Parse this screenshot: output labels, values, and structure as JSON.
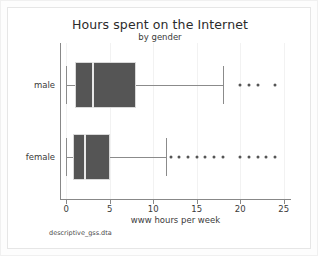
{
  "chart_data": {
    "type": "box",
    "title": "Hours spent on the Internet",
    "subtitle": "by gender",
    "xlabel": "www hours per week",
    "ylabel": "",
    "note": "descriptive_gss.dta",
    "xlim": [
      -0.6,
      25.6
    ],
    "xticks": [
      0,
      5,
      10,
      15,
      20,
      25
    ],
    "xticklabels": [
      "0",
      "5",
      "10",
      "15",
      "20",
      "25"
    ],
    "grid": "vertical",
    "orientation": "horizontal",
    "categories": [
      "male",
      "female"
    ],
    "boxes": [
      {
        "label": "male",
        "min": 0,
        "q1": 1,
        "median": 3,
        "q3": 8,
        "max": 18,
        "outliers": [
          20,
          21,
          22,
          24
        ]
      },
      {
        "label": "female",
        "min": 0,
        "q1": 0.8,
        "median": 2,
        "q3": 5,
        "max": 11.5,
        "outliers": [
          12,
          13,
          14,
          15,
          16,
          17,
          18,
          20,
          21,
          22,
          23,
          24
        ]
      }
    ]
  },
  "colors": {
    "box_fill": "#555555",
    "box_edge": "#d9d9d9",
    "median": "#e8e8e8",
    "whisker": "#8b8b8b",
    "axis": "#888888",
    "grid": "#f2f2f2",
    "background": "#ffffff",
    "text": "#3a3a3a"
  }
}
